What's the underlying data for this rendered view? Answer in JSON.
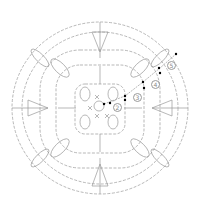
{
  "diagram": {
    "type": "crochet-chart",
    "title": "",
    "stroke_color": "#9a9a9a",
    "marker_color": "#000000",
    "rounds": [
      {
        "label": "2",
        "x": 113,
        "y": 106
      },
      {
        "label": "3",
        "x": 133,
        "y": 96
      },
      {
        "label": "4",
        "x": 151,
        "y": 83
      },
      {
        "label": "5",
        "x": 169,
        "y": 64
      }
    ],
    "rings": [
      {
        "name": "center-ring",
        "cx": 99,
        "cy": 106,
        "rx": 6,
        "ry": 6
      },
      {
        "name": "round-2",
        "cx": 100,
        "cy": 108,
        "rx": 24,
        "ry": 24
      },
      {
        "name": "round-3",
        "cx": 100,
        "cy": 108,
        "rx": 42,
        "ry": 42
      },
      {
        "name": "round-4",
        "cx": 100,
        "cy": 108,
        "rx": 62,
        "ry": 60
      },
      {
        "name": "round-5",
        "cx": 100,
        "cy": 108,
        "rx": 90,
        "ry": 88
      }
    ]
  }
}
